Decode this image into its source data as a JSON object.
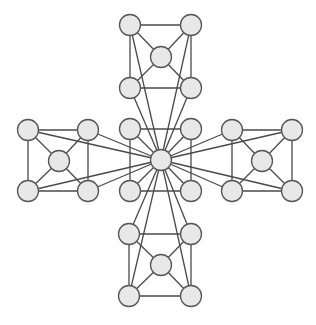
{
  "diagram": {
    "type": "graph",
    "style": {
      "background": "#ffffff",
      "node_fill": "#e8e8e8",
      "node_stroke": "#555555",
      "edge_color": "#4a4a4a",
      "node_radius": 10.5
    },
    "nodes": [
      {
        "id": "hub",
        "x": 161,
        "y": 160
      },
      {
        "id": "c_tl",
        "x": 130,
        "y": 129
      },
      {
        "id": "c_tr",
        "x": 191,
        "y": 129
      },
      {
        "id": "c_bl",
        "x": 130,
        "y": 191
      },
      {
        "id": "c_br",
        "x": 191,
        "y": 191
      },
      {
        "id": "t_tl",
        "x": 130,
        "y": 25
      },
      {
        "id": "t_tr",
        "x": 191,
        "y": 25
      },
      {
        "id": "t_c",
        "x": 161,
        "y": 57
      },
      {
        "id": "t_bl",
        "x": 130,
        "y": 88
      },
      {
        "id": "t_br",
        "x": 191,
        "y": 88
      },
      {
        "id": "b_tl",
        "x": 129,
        "y": 234
      },
      {
        "id": "b_tr",
        "x": 191,
        "y": 234
      },
      {
        "id": "b_c",
        "x": 161,
        "y": 265
      },
      {
        "id": "b_bl",
        "x": 129,
        "y": 296
      },
      {
        "id": "b_br",
        "x": 191,
        "y": 296
      },
      {
        "id": "l_tl",
        "x": 28,
        "y": 130
      },
      {
        "id": "l_tr",
        "x": 88,
        "y": 130
      },
      {
        "id": "l_c",
        "x": 59,
        "y": 161
      },
      {
        "id": "l_bl",
        "x": 28,
        "y": 191
      },
      {
        "id": "l_br",
        "x": 88,
        "y": 191
      },
      {
        "id": "r_tl",
        "x": 232,
        "y": 130
      },
      {
        "id": "r_tr",
        "x": 292,
        "y": 130
      },
      {
        "id": "r_c",
        "x": 262,
        "y": 161
      },
      {
        "id": "r_bl",
        "x": 232,
        "y": 191
      },
      {
        "id": "r_br",
        "x": 292,
        "y": 191
      }
    ],
    "edges": [
      [
        "c_tl",
        "c_tr"
      ],
      [
        "c_bl",
        "c_br"
      ],
      [
        "c_tl",
        "c_bl"
      ],
      [
        "c_tr",
        "c_br"
      ],
      [
        "c_tl",
        "hub"
      ],
      [
        "c_tr",
        "hub"
      ],
      [
        "c_bl",
        "hub"
      ],
      [
        "c_br",
        "hub"
      ],
      [
        "t_tl",
        "t_tr"
      ],
      [
        "t_bl",
        "t_br"
      ],
      [
        "t_tl",
        "t_bl"
      ],
      [
        "t_tr",
        "t_br"
      ],
      [
        "t_tl",
        "t_c"
      ],
      [
        "t_tr",
        "t_c"
      ],
      [
        "t_bl",
        "t_c"
      ],
      [
        "t_br",
        "t_c"
      ],
      [
        "t_tl",
        "hub"
      ],
      [
        "t_tr",
        "hub"
      ],
      [
        "t_bl",
        "hub"
      ],
      [
        "t_br",
        "hub"
      ],
      [
        "b_tl",
        "b_tr"
      ],
      [
        "b_bl",
        "b_br"
      ],
      [
        "b_tl",
        "b_bl"
      ],
      [
        "b_tr",
        "b_br"
      ],
      [
        "b_tl",
        "b_c"
      ],
      [
        "b_tr",
        "b_c"
      ],
      [
        "b_bl",
        "b_c"
      ],
      [
        "b_br",
        "b_c"
      ],
      [
        "b_tl",
        "hub"
      ],
      [
        "b_tr",
        "hub"
      ],
      [
        "b_bl",
        "hub"
      ],
      [
        "b_br",
        "hub"
      ],
      [
        "l_tl",
        "l_tr"
      ],
      [
        "l_bl",
        "l_br"
      ],
      [
        "l_tl",
        "l_bl"
      ],
      [
        "l_tr",
        "l_br"
      ],
      [
        "l_tl",
        "l_c"
      ],
      [
        "l_tr",
        "l_c"
      ],
      [
        "l_bl",
        "l_c"
      ],
      [
        "l_br",
        "l_c"
      ],
      [
        "l_tl",
        "hub"
      ],
      [
        "l_tr",
        "hub"
      ],
      [
        "l_bl",
        "hub"
      ],
      [
        "l_br",
        "hub"
      ],
      [
        "r_tl",
        "r_tr"
      ],
      [
        "r_bl",
        "r_br"
      ],
      [
        "r_tl",
        "r_bl"
      ],
      [
        "r_tr",
        "r_br"
      ],
      [
        "r_tl",
        "r_c"
      ],
      [
        "r_tr",
        "r_c"
      ],
      [
        "r_bl",
        "r_c"
      ],
      [
        "r_br",
        "r_c"
      ],
      [
        "r_tl",
        "hub"
      ],
      [
        "r_tr",
        "hub"
      ],
      [
        "r_bl",
        "hub"
      ],
      [
        "r_br",
        "hub"
      ]
    ]
  }
}
